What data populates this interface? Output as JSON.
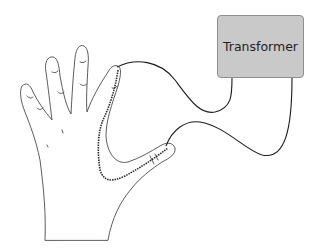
{
  "diagram": {
    "transformer": {
      "label": "Transformer",
      "fill": "#c9c9c9",
      "border": "#8f8f8f"
    },
    "hand": {
      "outline": "#4a4a4a",
      "fill": "#ffffff"
    },
    "wires": {
      "color": "#1a1a1a"
    },
    "current_path": {
      "style": "dashed",
      "color": "#2a2a2a"
    }
  }
}
